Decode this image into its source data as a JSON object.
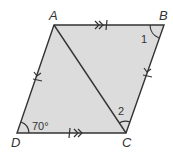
{
  "diagram": {
    "type": "parallelogram",
    "fill_color": "#dcdcdc",
    "stroke_color": "#333333",
    "vertices": {
      "A": {
        "label": "A",
        "x": 54,
        "y": 25
      },
      "B": {
        "label": "B",
        "x": 164,
        "y": 25
      },
      "C": {
        "label": "C",
        "x": 126,
        "y": 133
      },
      "D": {
        "label": "D",
        "x": 17,
        "y": 133
      }
    },
    "diagonal": [
      "A",
      "C"
    ],
    "angles": {
      "D": {
        "label": "70°"
      },
      "B": {
        "label": "1"
      },
      "C": {
        "label": "2"
      }
    },
    "markings": {
      "AB": "double arrow with tick",
      "DC": "double arrow with tick",
      "AD": "single arrow with tick",
      "BC": "single arrow with tick"
    }
  }
}
